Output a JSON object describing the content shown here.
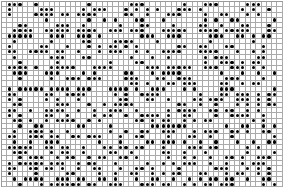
{
  "grid": {
    "columns": 53,
    "rows": 35,
    "dot_color": "#000000",
    "line_color": "#aaaaaa",
    "background": "#ffffff",
    "cells": [
      ".XXX..X.........X.......XXX.......X...XXX.....XXX....",
      ".X.....XXX.....X.XXX...X.X.X.X...XXX.X.......X.X..X.",
      ".X....XXXX.XX.XXXX.....XX..X...XXX....X..XX...X.X...",
      "........X.......X..X.X...XX...X.......X.X..XX......X",
      "...XX.....XXX..X......X...XX....X....XX..X...XX...X.",
      "..XXXX..XXXXX.XXXX..XXX.XXX...XXXXX..XXXX.XXXXX...XX",
      ".XXXXX...XXX..XXX.X.......XXX..XXX.....XXX..XX.X.XX.",
      "..X......X.....XX....XXXX....X.........X.......X....",
      ".X.....XX...X...X.X.XX.X.X.......XX..XX...XX.....X..",
      ".XX..XXXX.XX..X...X.XXX..X.X..XXXX...XXXX...X..X.X..",
      "..X......XXX...XX.......X...X..X......X.XXX.....XX..",
      "...X......X.........X....XX...........X..XXX.X.XX...",
      ".XXXX.X..XXXXX...XXXX......XXX.XXXXX..XXX..XXX.X.X..",
      "..XXX...XXX....X.X.....XX...X.XXXX.......X...X..X..X",
      "...X.....X..XXX.XXX....XXX...XX..XXX......XXX....X..",
      "........................XX.X...XX.XXX....XX..X.XX...",
      ".X.XXXXX.XXXX.XXX...XXXX.X..XXX...X.X....XXX.......X",
      ".XX.....XX..XXXX.....X.X..XXXX.......X...XX.XXX.X.XX",
      ".X.X....X.X...X.......XX...XX..X....XX.XXX..XXX.X.X.",
      "..XX......XXX...X..X.XXXX........XX..X..X...X.X.X.XX",
      ".XX..X..XXXX..X..X..XXX..X.....X.XXXX..XX.XX..X.X...",
      ".X.X....XX..X....X.XX..X..XXXX.X..XX....X..XXXX..X..",
      "..XX.X..X.XXXX..X.X......XX.X.XX..X.X.XX.......X.X..",
      "...X..XX......XX....X.......XXXXXXX.......X..XX..X.X",
      "..X..XXX.X..X.......X..X..XX..XXX...X.XXX..XX.X..XX.",
      ".XX..XXX.XX..XX.XXX...X..XX....X...XX..X...X.......X",
      "..X..X..XXX.......X...X....XX.XXX.X..X..X...X..X..XX",
      ".XXXXX..XX.XX..X...XX.XX.XX...X....XXX.XX.....X.X...",
      "..XXX....X.XX..X....XX..X.....XX..X...X.......X....X",
      "...X.XXX..X.XX..X.XX..XX.X.....X..X.X..X..XX.X..XXX.",
      ".X.XXXXX.XXX..X.XX...X.....X..X.X.XXX..X..X..X.XXX..",
      ".XX..XX.XX.X..X..XX...X..XX.X....X......XXX...X.X.X.",
      ".X....X.....XX....X..X..XX..X.X.XX...XX...X.XX..X.X.",
      "..X.XXXX..XXX.XX..XX.X...X..XX..X..X.X.XX.XX..X..XX.",
      "...X...X.XXXXXX.XX..XXX...XXX.XX..X.X.XX.XXX.....X.X"
    ]
  }
}
